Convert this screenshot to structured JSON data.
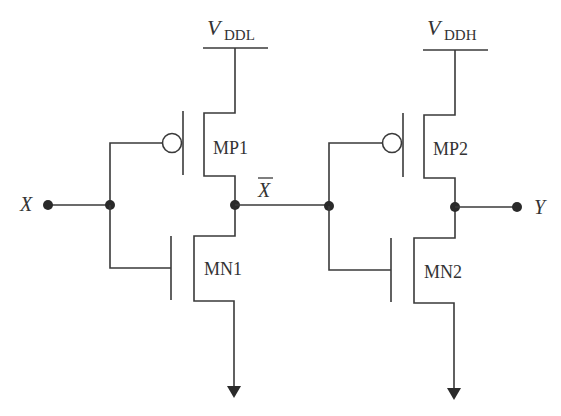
{
  "diagram": {
    "type": "circuit",
    "supplies": {
      "vddl": {
        "main": "V",
        "sub": "DDL"
      },
      "vddh": {
        "main": "V",
        "sub": "DDH"
      }
    },
    "transistors": {
      "mp1": "MP1",
      "mn1": "MN1",
      "mp2": "MP2",
      "mn2": "MN2"
    },
    "nodes": {
      "input": "X",
      "intermediate": "X",
      "output": "Y"
    },
    "colors": {
      "wire": "#3a3a3a",
      "text": "#333333",
      "background": "#ffffff"
    }
  }
}
